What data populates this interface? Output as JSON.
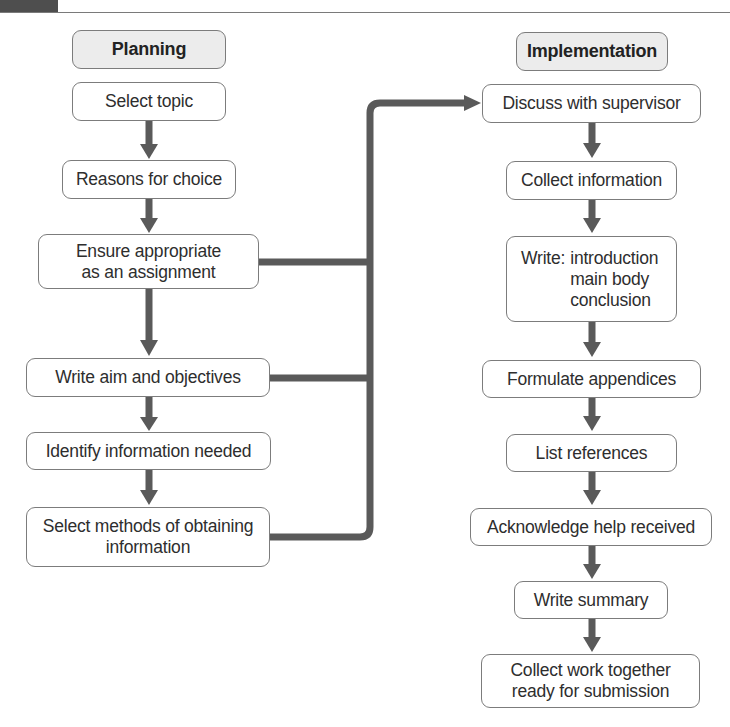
{
  "header": {
    "title_fragment": "...g ... p ... g p ...y ..."
  },
  "planning": {
    "title": "Planning",
    "steps": [
      {
        "label": "Select topic"
      },
      {
        "label": "Reasons for choice"
      },
      {
        "label_line1": "Ensure appropriate",
        "label_line2": "as an assignment"
      },
      {
        "label": "Write aim and objectives"
      },
      {
        "label": "Identify information needed"
      },
      {
        "label_line1": "Select methods of obtaining",
        "label_line2": "information"
      }
    ]
  },
  "implementation": {
    "title": "Implementation",
    "steps": [
      {
        "label": "Discuss with supervisor"
      },
      {
        "label": "Collect information"
      },
      {
        "prefix": "Write:",
        "lines": [
          "introduction",
          "main body",
          "conclusion"
        ]
      },
      {
        "label": "Formulate appendices"
      },
      {
        "label": "List references"
      },
      {
        "label": "Acknowledge help received"
      },
      {
        "label": "Write summary"
      },
      {
        "label_line1": "Collect work together",
        "label_line2": "ready for submission"
      }
    ]
  },
  "colors": {
    "arrow": "#5a5a5a",
    "box_border": "#7c7c7c",
    "header_fill": "#ececec",
    "header_bar": "#4e4e4e"
  }
}
